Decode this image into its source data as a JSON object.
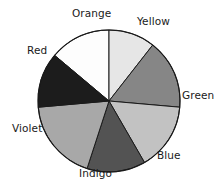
{
  "chart_data": {
    "type": "pie",
    "title": "",
    "subtitle": "",
    "xlabel": "",
    "ylabel": "",
    "grid": false,
    "legend_position": "none",
    "label_placement": "outside",
    "start_angle_deg": -50,
    "direction": "clockwise",
    "center": {
      "x": 109,
      "y": 101
    },
    "radius": 71,
    "outline_color": "#1a1a1a",
    "background": "#ffffff",
    "categories": [
      "Orange",
      "Yellow",
      "Green",
      "Blue",
      "Indigo",
      "Violet",
      "Red"
    ],
    "values": [
      50,
      38,
      57,
      55,
      48,
      67,
      45
    ],
    "slices": [
      {
        "label": "Orange",
        "value": 50,
        "percent": 13.9,
        "start_angle_deg": -50,
        "end_angle_deg": 0,
        "color": "#fdfdfd",
        "label_position": "top"
      },
      {
        "label": "Yellow",
        "value": 38,
        "percent": 10.6,
        "start_angle_deg": 0,
        "end_angle_deg": 38,
        "color": "#e6e6e6",
        "label_position": "top-right"
      },
      {
        "label": "Green",
        "value": 57,
        "percent": 15.8,
        "start_angle_deg": 38,
        "end_angle_deg": 95,
        "color": "#868686",
        "label_position": "right"
      },
      {
        "label": "Blue",
        "value": 55,
        "percent": 15.3,
        "start_angle_deg": 95,
        "end_angle_deg": 150,
        "color": "#c2c2c2",
        "label_position": "bottom-right"
      },
      {
        "label": "Indigo",
        "value": 48,
        "percent": 13.3,
        "start_angle_deg": 150,
        "end_angle_deg": 198,
        "color": "#535353",
        "label_position": "bottom"
      },
      {
        "label": "Violet",
        "value": 67,
        "percent": 18.6,
        "start_angle_deg": 198,
        "end_angle_deg": 265,
        "color": "#a8a8a8",
        "label_position": "left"
      },
      {
        "label": "Red",
        "value": 45,
        "percent": 12.5,
        "start_angle_deg": 265,
        "end_angle_deg": 310,
        "color": "#1c1c1c",
        "label_position": "top-left"
      }
    ],
    "label_coords": [
      {
        "label": "Orange",
        "x": 72,
        "y": 8
      },
      {
        "label": "Yellow",
        "x": 137,
        "y": 16
      },
      {
        "label": "Green",
        "x": 182,
        "y": 90
      },
      {
        "label": "Blue",
        "x": 157,
        "y": 150
      },
      {
        "label": "Indigo",
        "x": 79,
        "y": 168
      },
      {
        "label": "Violet",
        "x": 12,
        "y": 123
      },
      {
        "label": "Red",
        "x": 27,
        "y": 45
      }
    ]
  }
}
